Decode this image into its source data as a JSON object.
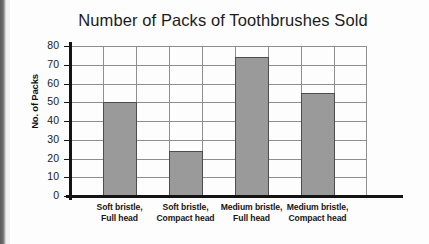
{
  "chart_data": {
    "type": "bar",
    "title": "Number of Packs of Toothbrushes Sold",
    "xlabel": "",
    "ylabel": "No. of Packs",
    "categories": [
      "Soft bristle,\nFull head",
      "Soft bristle,\nCompact head",
      "Medium bristle,\nFull head",
      "Medium bristle,\nCompact head"
    ],
    "category_lines": [
      [
        "Soft bristle,",
        "Full head"
      ],
      [
        "Soft bristle,",
        "Compact head"
      ],
      [
        "Medium bristle,",
        "Full head"
      ],
      [
        "Medium bristle,",
        "Compact head"
      ]
    ],
    "values": [
      50,
      24,
      74,
      55
    ],
    "ylim": [
      0,
      80
    ],
    "ytick_labels": [
      "80",
      "70",
      "60",
      "50",
      "40",
      "30",
      "20",
      "10",
      "0"
    ],
    "ytick_values": [
      80,
      70,
      60,
      50,
      40,
      30,
      20,
      10,
      0
    ],
    "grid": "both",
    "legend": "none",
    "bar_color": "#9a9a9a",
    "bar_border_color": "#4d4d4d",
    "axis_color": "#141414",
    "grid_color": "#8e8e8e"
  }
}
